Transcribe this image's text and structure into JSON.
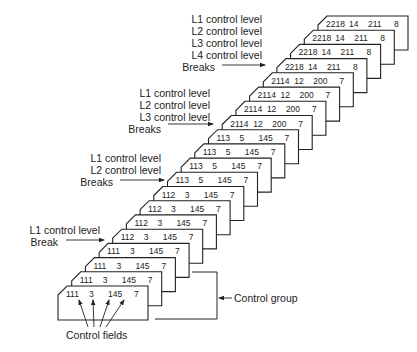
{
  "diagram": {
    "colors": {
      "stroke": "#222222",
      "card_fill": "#ffffff",
      "text": "#222222"
    },
    "cards": [
      {
        "fields": [
          "111",
          "3",
          "145",
          "7"
        ]
      },
      {
        "fields": [
          "111",
          "3",
          "145",
          "7"
        ]
      },
      {
        "fields": [
          "111",
          "3",
          "145",
          "7"
        ]
      },
      {
        "fields": [
          "111",
          "3",
          "145",
          "7"
        ]
      },
      {
        "fields": [
          "112",
          "3",
          "145",
          "7"
        ]
      },
      {
        "fields": [
          "112",
          "3",
          "145",
          "7"
        ]
      },
      {
        "fields": [
          "112",
          "3",
          "145",
          "7"
        ]
      },
      {
        "fields": [
          "112",
          "3",
          "145",
          "7"
        ]
      },
      {
        "fields": [
          "113",
          "5",
          "145",
          "7"
        ]
      },
      {
        "fields": [
          "113",
          "5",
          "145",
          "7"
        ]
      },
      {
        "fields": [
          "113",
          "5",
          "145",
          "7"
        ]
      },
      {
        "fields": [
          "113",
          "5",
          "145",
          "7"
        ]
      },
      {
        "fields": [
          "2114",
          "12",
          "200",
          "7"
        ]
      },
      {
        "fields": [
          "2114",
          "12",
          "200",
          "7"
        ]
      },
      {
        "fields": [
          "2114",
          "12",
          "200",
          "7"
        ]
      },
      {
        "fields": [
          "2114",
          "12",
          "200",
          "7"
        ]
      },
      {
        "fields": [
          "2218",
          "14",
          "211",
          "8"
        ]
      },
      {
        "fields": [
          "2218",
          "14",
          "211",
          "8"
        ]
      },
      {
        "fields": [
          "2218",
          "14",
          "211",
          "8"
        ]
      },
      {
        "fields": [
          "2218",
          "14",
          "211",
          "8"
        ]
      }
    ],
    "break_labels": [
      {
        "lines": [
          "L1 control level",
          "Break"
        ],
        "right": 100,
        "top": 224,
        "arrow_y": 240,
        "arrow_x1": 66,
        "arrow_x2": 104
      },
      {
        "lines": [
          "L1 control level",
          "L2 control level",
          "Breaks"
        ],
        "right": 161,
        "top": 152,
        "arrow_y": 180,
        "arrow_x1": 120,
        "arrow_x2": 164
      },
      {
        "lines": [
          "L1 control level",
          "L2 control level",
          "L3 control level",
          "Breaks"
        ],
        "right": 210,
        "top": 87,
        "arrow_y": 124,
        "arrow_x1": 168,
        "arrow_x2": 213
      },
      {
        "lines": [
          "L1 control level",
          "L2 control level",
          "L3 control level",
          "L4 control level",
          "Breaks"
        ],
        "right": 262,
        "top": 13,
        "arrow_y": 65,
        "arrow_x1": 222,
        "arrow_x2": 265
      }
    ],
    "control_group_label": "Control group",
    "control_fields_label": "Control fields"
  }
}
